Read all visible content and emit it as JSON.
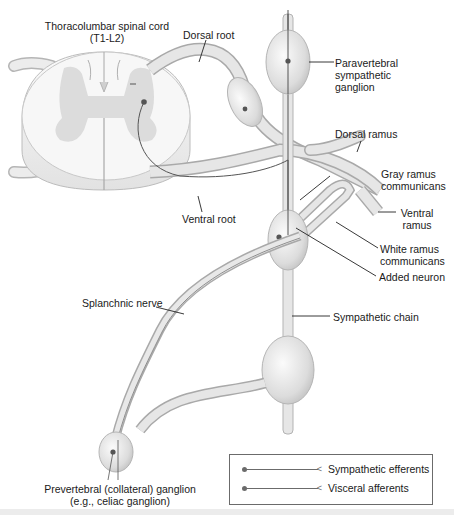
{
  "diagram": {
    "labels": {
      "spinal_cord": [
        "Thoracolumbar spinal cord",
        "(T1-L2)"
      ],
      "dorsal_root": "Dorsal root",
      "ventral_root": "Ventral root",
      "paravertebral_ganglion": [
        "Paravertebral",
        "sympathetic",
        "ganglion"
      ],
      "dorsal_ramus": "Dorsal ramus",
      "gray_ramus": [
        "Gray ramus",
        "communicans"
      ],
      "ventral_ramus": [
        "Ventral",
        "ramus"
      ],
      "white_ramus": [
        "White ramus",
        "communicans"
      ],
      "added_neuron": "Added neuron",
      "splanchnic_nerve": "Splanchnic nerve",
      "sympathetic_chain": "Sympathetic chain",
      "prevertebral_ganglion": [
        "Prevertebral (collateral) ganglion",
        "(e.g., celiac ganglion)"
      ]
    },
    "legend": {
      "items": [
        {
          "label": "Sympathetic efferents",
          "color": "#6b6b6b"
        },
        {
          "label": "Visceral afferents",
          "color": "#6b6b6b"
        }
      ]
    },
    "colors": {
      "nerve_fill": "#e4e4e4",
      "nerve_edge": "#a8a8a8",
      "gray_matter": "#d6d6d6",
      "white_matter": "#f4f4f4",
      "fiber": "#555555",
      "leader": "#222222"
    }
  }
}
